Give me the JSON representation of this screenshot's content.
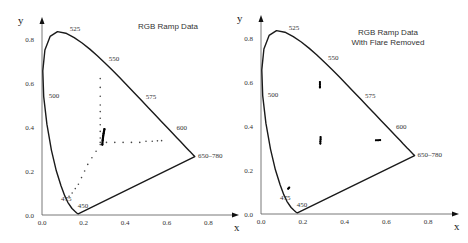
{
  "chart_data": [
    {
      "type": "scatter",
      "panel": "left",
      "title": "RGB Ramp Data",
      "xlabel": "x",
      "ylabel": "y",
      "xlim": [
        0,
        0.85
      ],
      "ylim": [
        0,
        0.83
      ],
      "x_ticks": [
        "0.0",
        "0.2",
        "0.4",
        "0.6",
        "0.8"
      ],
      "y_ticks": [
        "0.0",
        "0.2",
        "0.4",
        "0.6",
        "0.8"
      ],
      "grid": false,
      "legend": null,
      "wavelength_labels": [
        {
          "label": "525",
          "x": 0.114,
          "y": 0.826
        },
        {
          "label": "550",
          "x": 0.302,
          "y": 0.692
        },
        {
          "label": "575",
          "x": 0.479,
          "y": 0.52
        },
        {
          "label": "600",
          "x": 0.627,
          "y": 0.373
        },
        {
          "label": "650–780",
          "x": 0.735,
          "y": 0.265
        },
        {
          "label": "500",
          "x": 0.008,
          "y": 0.538
        },
        {
          "label": "475",
          "x": 0.11,
          "y": 0.087
        },
        {
          "label": "450",
          "x": 0.157,
          "y": 0.018
        }
      ],
      "series": [
        {
          "name": "green ramp",
          "points": [
            [
              0.28,
              0.62
            ],
            [
              0.28,
              0.58
            ],
            [
              0.28,
              0.54
            ],
            [
              0.28,
              0.5
            ],
            [
              0.28,
              0.47
            ],
            [
              0.28,
              0.44
            ],
            [
              0.28,
              0.41
            ],
            [
              0.28,
              0.38
            ],
            [
              0.28,
              0.35
            ],
            [
              0.28,
              0.33
            ]
          ]
        },
        {
          "name": "red ramp",
          "points": [
            [
              0.31,
              0.33
            ],
            [
              0.35,
              0.33
            ],
            [
              0.39,
              0.33
            ],
            [
              0.43,
              0.33
            ],
            [
              0.47,
              0.33
            ],
            [
              0.5,
              0.335
            ],
            [
              0.53,
              0.335
            ],
            [
              0.555,
              0.337
            ],
            [
              0.575,
              0.338
            ]
          ]
        },
        {
          "name": "blue ramp",
          "points": [
            [
              0.28,
              0.32
            ],
            [
              0.26,
              0.29
            ],
            [
              0.24,
              0.26
            ],
            [
              0.22,
              0.23
            ],
            [
              0.205,
              0.2
            ],
            [
              0.19,
              0.17
            ],
            [
              0.175,
              0.14
            ],
            [
              0.16,
              0.12
            ],
            [
              0.145,
              0.1
            ],
            [
              0.13,
              0.085
            ]
          ]
        },
        {
          "name": "neutral ramp",
          "points": [
            [
              0.29,
              0.32
            ],
            [
              0.292,
              0.34
            ],
            [
              0.294,
              0.36
            ],
            [
              0.296,
              0.37
            ],
            [
              0.298,
              0.38
            ],
            [
              0.3,
              0.39
            ]
          ]
        }
      ]
    },
    {
      "type": "scatter",
      "panel": "right",
      "title": "RGB Ramp Data\nWith Flare Removed",
      "title_lines": [
        "RGB Ramp Data",
        "With Flare Removed"
      ],
      "xlabel": "x",
      "ylabel": "y",
      "xlim": [
        0,
        0.85
      ],
      "ylim": [
        0,
        0.83
      ],
      "x_ticks": [
        "0.0",
        "0.2",
        "0.4",
        "0.6",
        "0.8"
      ],
      "y_ticks": [
        "0.0",
        "0.2",
        "0.4",
        "0.6",
        "0.8"
      ],
      "grid": false,
      "legend": null,
      "wavelength_labels": [
        {
          "label": "525",
          "x": 0.114,
          "y": 0.826
        },
        {
          "label": "550",
          "x": 0.302,
          "y": 0.692
        },
        {
          "label": "575",
          "x": 0.479,
          "y": 0.52
        },
        {
          "label": "600",
          "x": 0.627,
          "y": 0.373
        },
        {
          "label": "650–780",
          "x": 0.735,
          "y": 0.265
        },
        {
          "label": "500",
          "x": 0.008,
          "y": 0.538
        },
        {
          "label": "475",
          "x": 0.11,
          "y": 0.087
        },
        {
          "label": "450",
          "x": 0.157,
          "y": 0.018
        }
      ],
      "series": [
        {
          "name": "green ramp",
          "points": [
            [
              0.282,
              0.6
            ],
            [
              0.282,
              0.59
            ],
            [
              0.282,
              0.58
            ],
            [
              0.282,
              0.575
            ]
          ]
        },
        {
          "name": "red ramp",
          "points": [
            [
              0.55,
              0.335
            ],
            [
              0.56,
              0.335
            ],
            [
              0.57,
              0.336
            ]
          ]
        },
        {
          "name": "blue ramp",
          "points": [
            [
              0.135,
              0.12
            ],
            [
              0.13,
              0.115
            ]
          ]
        },
        {
          "name": "neutral ramp",
          "points": [
            [
              0.284,
              0.32
            ],
            [
              0.284,
              0.33
            ],
            [
              0.285,
              0.34
            ],
            [
              0.285,
              0.35
            ]
          ]
        }
      ]
    }
  ],
  "spectral_locus": [
    [
      0.1741,
      0.005
    ],
    [
      0.1666,
      0.0089
    ],
    [
      0.1566,
      0.0177
    ],
    [
      0.144,
      0.0297
    ],
    [
      0.1241,
      0.0578
    ],
    [
      0.1096,
      0.0868
    ],
    [
      0.0913,
      0.1327
    ],
    [
      0.0687,
      0.2007
    ],
    [
      0.0454,
      0.295
    ],
    [
      0.0235,
      0.4127
    ],
    [
      0.0082,
      0.5384
    ],
    [
      0.0039,
      0.6548
    ],
    [
      0.0139,
      0.7502
    ],
    [
      0.0389,
      0.812
    ],
    [
      0.0743,
      0.8338
    ],
    [
      0.1142,
      0.8262
    ],
    [
      0.1547,
      0.8059
    ],
    [
      0.1929,
      0.7816
    ],
    [
      0.2296,
      0.7543
    ],
    [
      0.2658,
      0.7243
    ],
    [
      0.3016,
      0.6923
    ],
    [
      0.3373,
      0.6589
    ],
    [
      0.3731,
      0.6245
    ],
    [
      0.4087,
      0.5896
    ],
    [
      0.4441,
      0.5547
    ],
    [
      0.4788,
      0.5202
    ],
    [
      0.5125,
      0.4866
    ],
    [
      0.5448,
      0.4544
    ],
    [
      0.5752,
      0.4242
    ],
    [
      0.6029,
      0.3965
    ],
    [
      0.627,
      0.3725
    ],
    [
      0.6482,
      0.3514
    ],
    [
      0.6658,
      0.334
    ],
    [
      0.6801,
      0.3197
    ],
    [
      0.6915,
      0.3083
    ],
    [
      0.7006,
      0.2993
    ],
    [
      0.7079,
      0.292
    ],
    [
      0.714,
      0.2859
    ],
    [
      0.719,
      0.2809
    ],
    [
      0.723,
      0.277
    ],
    [
      0.726,
      0.274
    ],
    [
      0.7347,
      0.2653
    ]
  ],
  "panels": {
    "left": {
      "x0": 42,
      "y0": 215,
      "sx": 208,
      "sy": 220,
      "ax_x_end": 232,
      "ax_y_top": 18
    },
    "right": {
      "x0": 261,
      "y0": 214,
      "sx": 209,
      "sy": 220,
      "ax_x_end": 452,
      "ax_y_top": 16
    }
  },
  "colors": {
    "locus": "#1a1a1a",
    "axis": "#555555",
    "points": "#444444",
    "dense": "#000000"
  }
}
